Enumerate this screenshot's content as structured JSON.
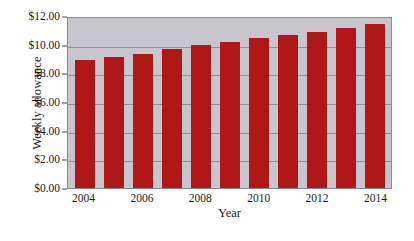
{
  "chart_data": {
    "type": "bar",
    "title": "",
    "xlabel": "Year",
    "ylabel": "Weekly allowance",
    "categories": [
      "2004",
      "2005",
      "2006",
      "2007",
      "2008",
      "2009",
      "2010",
      "2011",
      "2012",
      "2013",
      "2014"
    ],
    "values": [
      8.95,
      9.15,
      9.38,
      9.67,
      9.95,
      10.17,
      10.45,
      10.65,
      10.9,
      11.18,
      11.45
    ],
    "ylim": [
      0,
      12
    ],
    "ytick_values": [
      0,
      2,
      4,
      6,
      8,
      10,
      12
    ],
    "ytick_labels": [
      "$0.00",
      "$2.00",
      "$4.00",
      "$6.00",
      "$8.00",
      "$10.00",
      "$12.00"
    ],
    "xtick_labels": [
      "2004",
      "2006",
      "2008",
      "2010",
      "2012",
      "2014"
    ],
    "xtick_categories": [
      "2004",
      "2006",
      "2008",
      "2010",
      "2012",
      "2014"
    ],
    "grid": true,
    "legend": "none",
    "bar_color": "#b01818",
    "plot_background": "#c7c6ce",
    "gridline_color": "#8f8f99",
    "axis_color": "#4a4a52",
    "page_background": "#ffffff"
  }
}
